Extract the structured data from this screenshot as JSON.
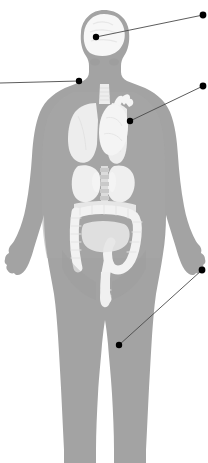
{
  "figure": {
    "width": 208,
    "height": 463,
    "background_color": "#ffffff"
  },
  "colors": {
    "body_silhouette": "#a3a3a3",
    "body_silhouette_light": "#b0b0b0",
    "organ_light": "#f2f2f2",
    "organ_mid": "#e2e2e2",
    "organ_pale": "#ededed",
    "organ_shadow": "#d4d4d4",
    "leader_line": "#4a4a4a",
    "leader_dot": "#000000",
    "background": "#ffffff"
  },
  "body": {
    "name": "female-body-silhouette",
    "view": "anterior",
    "fill": "#a3a3a3"
  },
  "organs": [
    {
      "id": "brain",
      "label": "brain",
      "fill": "#f7f7f7",
      "region": "head"
    },
    {
      "id": "trachea",
      "label": "trachea",
      "fill": "#ededed",
      "region": "neck"
    },
    {
      "id": "lung-left",
      "label": "left lung",
      "fill": "#ededed",
      "region": "thorax"
    },
    {
      "id": "lung-right",
      "label": "right lung",
      "fill": "#ededed",
      "region": "thorax"
    },
    {
      "id": "heart",
      "label": "heart",
      "fill": "#f4f4f4",
      "region": "thorax"
    },
    {
      "id": "liver",
      "label": "liver",
      "fill": "#efefef",
      "region": "abdomen"
    },
    {
      "id": "stomach",
      "label": "stomach",
      "fill": "#efefef",
      "region": "abdomen"
    },
    {
      "id": "spine",
      "label": "spine",
      "fill": "#dcdcdc",
      "region": "abdomen"
    },
    {
      "id": "kidney-left",
      "label": "left kidney",
      "fill": "#f4f4f4",
      "region": "abdomen"
    },
    {
      "id": "kidney-right",
      "label": "right kidney",
      "fill": "#f4f4f4",
      "region": "abdomen"
    },
    {
      "id": "large-intestine",
      "label": "large intestine / colon",
      "fill": "#f2f2f2",
      "region": "abdomen"
    },
    {
      "id": "small-intestine",
      "label": "small intestine",
      "fill": "#e6e6e6",
      "region": "abdomen"
    },
    {
      "id": "rectum",
      "label": "rectum",
      "fill": "#f0f0f0",
      "region": "pelvis"
    }
  ],
  "callouts": [
    {
      "id": "callout-head",
      "name": "callout-head",
      "target_label": "brain",
      "dot": {
        "x": 96,
        "y": 37
      },
      "line_end": {
        "x": 203,
        "y": 15
      },
      "side": "right"
    },
    {
      "id": "callout-neck",
      "name": "callout-neck",
      "target_label": "neck / throat",
      "dot": {
        "x": 79,
        "y": 81
      },
      "line_end": {
        "x": 0,
        "y": 83
      },
      "side": "left"
    },
    {
      "id": "callout-chest",
      "name": "callout-chest",
      "target_label": "heart / chest",
      "dot": {
        "x": 130,
        "y": 121
      },
      "line_end": {
        "x": 203,
        "y": 86
      },
      "side": "right"
    },
    {
      "id": "callout-leg",
      "name": "callout-leg",
      "target_label": "leg / thigh",
      "dot": {
        "x": 119,
        "y": 345
      },
      "line_end": {
        "x": 202,
        "y": 270
      },
      "side": "right"
    }
  ],
  "geometry": {
    "dot_radius": 3.2,
    "line_width": 0.9
  }
}
